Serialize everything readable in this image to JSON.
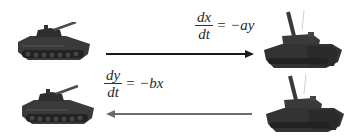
{
  "diagram": {
    "top_equation": {
      "numerator": "dx",
      "denominator": "dt",
      "rhs": "= −ay"
    },
    "bottom_equation": {
      "numerator": "dy",
      "denominator": "dt",
      "rhs": "= −bx"
    },
    "top_arrow": {
      "direction": "right",
      "color": "#1a1a1a"
    },
    "bottom_arrow": {
      "direction": "left",
      "color": "#6b6b6b"
    },
    "units": {
      "top_left": "infantry-fighting-vehicle",
      "top_right": "main-battle-tank",
      "bottom_left": "infantry-fighting-vehicle",
      "bottom_right": "main-battle-tank"
    },
    "colors": {
      "vehicle": "#3a3a3a",
      "vehicle_dark": "#222222",
      "vehicle_light": "#555555"
    }
  }
}
